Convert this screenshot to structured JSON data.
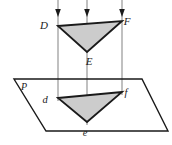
{
  "figure": {
    "colors": {
      "background": "#ffffff",
      "triangle_fill": "#cccccc",
      "triangle_stroke": "#1a1a1a",
      "plane_stroke": "#1a1a1a",
      "projection_line": "#8c8c8c",
      "arrow_head": "#1a1a1a",
      "label_color": "#1a1a1a"
    },
    "upper_triangle": {
      "name": "DEF",
      "vertices": [
        {
          "label": "D",
          "x": 58,
          "y": 26,
          "label_x": 44,
          "label_y": 29
        },
        {
          "label": "F",
          "x": 122,
          "y": 21,
          "label_x": 127,
          "label_y": 25
        },
        {
          "label": "E",
          "x": 87,
          "y": 52,
          "label_x": 89,
          "label_y": 65
        }
      ]
    },
    "lower_triangle": {
      "name": "def",
      "vertices": [
        {
          "label": "d",
          "x": 58,
          "y": 98,
          "label_x": 45,
          "label_y": 103
        },
        {
          "label": "f",
          "x": 122,
          "y": 92,
          "label_x": 126,
          "label_y": 96
        },
        {
          "label": "e",
          "x": 87,
          "y": 122,
          "label_x": 85,
          "label_y": 136
        }
      ]
    },
    "plane": {
      "label": "P",
      "label_x": 24,
      "label_y": 90,
      "corners": [
        {
          "x": 14,
          "y": 79
        },
        {
          "x": 142,
          "y": 79
        },
        {
          "x": 168,
          "y": 131
        },
        {
          "x": 46,
          "y": 131
        }
      ]
    },
    "projection_lines": [
      {
        "name": "projection-line-d",
        "x": 58,
        "y_top": 0,
        "y_bottom": 101,
        "arrow_y": 17
      },
      {
        "name": "projection-line-e",
        "x": 87,
        "y_top": 0,
        "y_bottom": 125,
        "arrow_y": 17
      },
      {
        "name": "projection-line-f",
        "x": 122,
        "y_top": 0,
        "y_bottom": 95,
        "arrow_y": 17
      }
    ]
  }
}
